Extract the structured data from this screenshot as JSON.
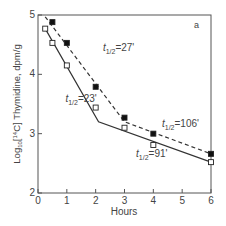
{
  "chart_data": {
    "type": "line",
    "panel_label": "a",
    "xlabel": "Hours",
    "ylabel": "Log10[14C] Thymidine, dpm/g",
    "ylabel_parts": {
      "prefix": "Log",
      "sub": "10",
      "bracket_open": "[",
      "sup": "14",
      "rest": "C] Thymidine, dpm/g"
    },
    "xlim": [
      0,
      6
    ],
    "ylim": [
      2,
      5
    ],
    "xticks": [
      0,
      1,
      2,
      3,
      4,
      5,
      6
    ],
    "xtick_labels": [
      "0",
      "1",
      "2",
      "3",
      "4",
      "5",
      "6"
    ],
    "yticks": [
      2,
      3,
      4,
      5
    ],
    "ytick_labels": [
      "2",
      "3",
      "4",
      "5"
    ],
    "grid": false,
    "series": [
      {
        "name": "filled squares (dashed)",
        "marker": "filled-square",
        "line_style": "dashed",
        "x": [
          0.5,
          1,
          2,
          3,
          4,
          6
        ],
        "y": [
          4.88,
          4.53,
          3.79,
          3.27,
          3.0,
          2.66
        ],
        "fit_line": {
          "x": [
            0.25,
            3,
            6
          ],
          "y": [
            4.97,
            3.2,
            2.66
          ]
        }
      },
      {
        "name": "open squares (solid)",
        "marker": "open-square",
        "line_style": "solid",
        "x": [
          0.25,
          0.5,
          1,
          2,
          3,
          4,
          6
        ],
        "y": [
          4.77,
          4.53,
          4.15,
          3.44,
          3.1,
          2.81,
          2.52
        ],
        "fit_line": {
          "x": [
            0.25,
            2.1,
            6
          ],
          "y": [
            4.77,
            3.2,
            2.52
          ]
        }
      }
    ],
    "annotations": [
      {
        "text_main": "t",
        "text_sub": "1/2",
        "text_value": "=27'",
        "x": 2.25,
        "y": 4.4
      },
      {
        "text_main": "t",
        "text_sub": "1/2",
        "text_value": "=23'",
        "x": 0.95,
        "y": 3.53
      },
      {
        "text_main": "t",
        "text_sub": "1/2",
        "text_value": "=106'",
        "x": 4.3,
        "y": 3.12
      },
      {
        "text_main": "t",
        "text_sub": "1/2",
        "text_value": "=91'",
        "x": 3.4,
        "y": 2.6
      }
    ]
  }
}
